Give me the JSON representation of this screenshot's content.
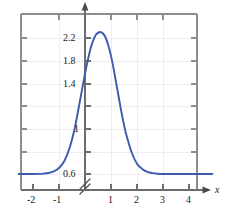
{
  "chart_data": {
    "type": "line",
    "title": "",
    "subtitle": "",
    "xlabel": "x",
    "ylabel": "",
    "xlim": [
      -2.55,
      4.9
    ],
    "ylim": [
      0.52,
      2.42
    ],
    "grid": true,
    "legend": null,
    "axis_break": {
      "axis": "y",
      "note": "y-axis broken below 0.6",
      "symbol": "//"
    },
    "x_ticks": [
      -2,
      -1,
      1,
      2,
      3,
      4
    ],
    "x_tick_labels": [
      "-2",
      "-1",
      "1",
      "2",
      "3",
      "4"
    ],
    "y_ticks": [
      0.6,
      1.0,
      1.4,
      1.8,
      2.2
    ],
    "y_tick_labels": [
      "0.6",
      "1",
      "1.4",
      "1.8",
      "2.2"
    ],
    "y_labeled_ticks": [
      "0.6",
      "1",
      "1.4",
      "1.8",
      "2.2"
    ],
    "series": [
      {
        "name": "curve",
        "color": "#3a5bb0",
        "x": [
          -2.55,
          -2.3,
          -2.0,
          -1.8,
          -1.6,
          -1.4,
          -1.2,
          -1.0,
          -0.8,
          -0.6,
          -0.4,
          -0.2,
          0.0,
          0.1,
          0.2,
          0.3,
          0.4,
          0.5,
          0.6,
          0.7,
          0.8,
          0.9,
          1.0,
          1.1,
          1.2,
          1.3,
          1.4,
          1.5,
          1.6,
          1.8,
          2.0,
          2.2,
          2.4,
          2.6,
          2.8,
          3.0,
          3.3,
          3.6,
          4.0,
          4.4,
          4.9
        ],
        "y": [
          0.6,
          0.6,
          0.6,
          0.601,
          0.604,
          0.612,
          0.63,
          0.67,
          0.75,
          0.9,
          1.13,
          1.45,
          1.78,
          1.93,
          2.06,
          2.16,
          2.23,
          2.26,
          2.27,
          2.25,
          2.2,
          2.11,
          1.99,
          1.84,
          1.67,
          1.5,
          1.33,
          1.18,
          1.05,
          0.85,
          0.72,
          0.66,
          0.625,
          0.61,
          0.603,
          0.6,
          0.6,
          0.6,
          0.6,
          0.6,
          0.6
        ]
      }
    ],
    "colors": {
      "curve": "#3a5bb0",
      "frame": "#8a8a8a",
      "axis": "#6b6b6b",
      "grid": "#ebebeb",
      "text": "#1a1a1a",
      "background": "#ffffff"
    }
  },
  "labels": {
    "x_axis_name": "x",
    "y_ticks": [
      {
        "text": "2.2",
        "value": 2.2
      },
      {
        "text": "1.8",
        "value": 1.8
      },
      {
        "text": "1.4",
        "value": 1.4
      },
      {
        "text": "1",
        "value": 1.0
      },
      {
        "text": "0.6",
        "value": 0.6
      }
    ],
    "x_ticks": [
      {
        "text": "-2",
        "value": -2
      },
      {
        "text": "-1",
        "value": -1
      },
      {
        "text": "1",
        "value": 1
      },
      {
        "text": "2",
        "value": 2
      },
      {
        "text": "3",
        "value": 3
      },
      {
        "text": "4",
        "value": 4
      }
    ]
  }
}
